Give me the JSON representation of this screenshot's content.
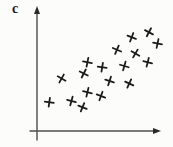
{
  "figure": {
    "corner_label": "c",
    "background": "#fcfcfa"
  },
  "chart_data": {
    "type": "scatter",
    "title": "",
    "xlabel": "",
    "ylabel": "",
    "corner_label": "c",
    "grid": false,
    "legend": null,
    "axes": {
      "x": {
        "arrow": true,
        "ticks": [],
        "tick_labels": [],
        "range": [
          0,
          1
        ]
      },
      "y": {
        "arrow": true,
        "ticks": [],
        "tick_labels": [],
        "range": [
          0,
          1
        ]
      }
    },
    "style": {
      "marker_shape": "hand-drawn-cross",
      "marker_color": "#1c1c1c",
      "marker_size_px": 9,
      "axis_color": "#4d4d4d"
    },
    "points": [
      {
        "x": 0.1,
        "y": 0.23
      },
      {
        "x": 0.28,
        "y": 0.24
      },
      {
        "x": 0.37,
        "y": 0.19
      },
      {
        "x": 0.2,
        "y": 0.42
      },
      {
        "x": 0.41,
        "y": 0.31
      },
      {
        "x": 0.52,
        "y": 0.28
      },
      {
        "x": 0.38,
        "y": 0.46
      },
      {
        "x": 0.41,
        "y": 0.55
      },
      {
        "x": 0.59,
        "y": 0.4
      },
      {
        "x": 0.75,
        "y": 0.38
      },
      {
        "x": 0.53,
        "y": 0.51
      },
      {
        "x": 0.71,
        "y": 0.52
      },
      {
        "x": 0.65,
        "y": 0.65
      },
      {
        "x": 0.8,
        "y": 0.62
      },
      {
        "x": 0.9,
        "y": 0.55
      },
      {
        "x": 0.77,
        "y": 0.75
      },
      {
        "x": 0.91,
        "y": 0.79
      },
      {
        "x": 0.98,
        "y": 0.7
      }
    ]
  }
}
